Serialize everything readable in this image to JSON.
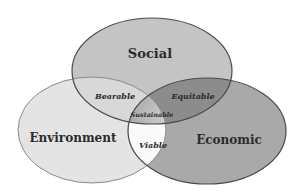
{
  "diagram": {
    "type": "venn",
    "sets": [
      {
        "id": "social",
        "label": "Social",
        "fill": "#c4c4c4"
      },
      {
        "id": "environment",
        "label": "Environment",
        "fill": "#e4e4e4"
      },
      {
        "id": "economic",
        "label": "Economic",
        "fill": "#a9a9a9"
      }
    ],
    "intersections": [
      {
        "sets": [
          "social",
          "environment"
        ],
        "label": "Bearable",
        "fill": "#d8d8d8"
      },
      {
        "sets": [
          "social",
          "economic"
        ],
        "label": "Equitable",
        "fill": "#8c8c8c"
      },
      {
        "sets": [
          "environment",
          "economic"
        ],
        "label": "Viable",
        "fill": "#fafafa"
      },
      {
        "sets": [
          "social",
          "environment",
          "economic"
        ],
        "label": "Sustainable",
        "fill": "#b8b8b8"
      }
    ],
    "outline_color": "#4a4a4a"
  }
}
